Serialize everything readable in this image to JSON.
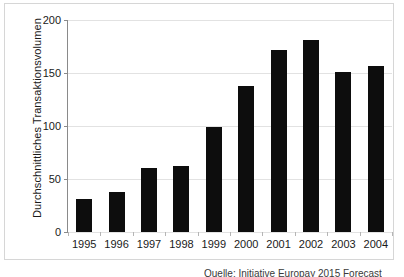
{
  "chart_data": {
    "type": "bar",
    "title": "",
    "subtitle": "",
    "xlabel": "",
    "ylabel": "Durchschnittliches Transaktionsvolumen",
    "categories": [
      "1995",
      "1996",
      "1997",
      "1998",
      "1999",
      "2000",
      "2001",
      "2002",
      "2003",
      "2004"
    ],
    "values": [
      31,
      38,
      60,
      62,
      99,
      138,
      172,
      181,
      151,
      157
    ],
    "series": [
      {
        "name": "Durchschnittliches Transaktionsvolumen",
        "values": [
          31,
          38,
          60,
          62,
          99,
          138,
          172,
          181,
          151,
          157
        ]
      }
    ],
    "ylim": [
      0,
      200
    ],
    "y_ticks": [
      0,
      50,
      100,
      150,
      200
    ],
    "y_tick_labels": [
      "0",
      "50",
      "100",
      "150",
      "200"
    ],
    "grid": "horizontal",
    "legend": "none",
    "bar_color": "#0d0d0d",
    "gridline_color": "#e2e2e2",
    "axis_color": "#8a8a8a",
    "frame_color": "#d6d6d6"
  },
  "footer": {
    "source_note": "Quelle: Initiative Europay 2015 Forecast"
  }
}
